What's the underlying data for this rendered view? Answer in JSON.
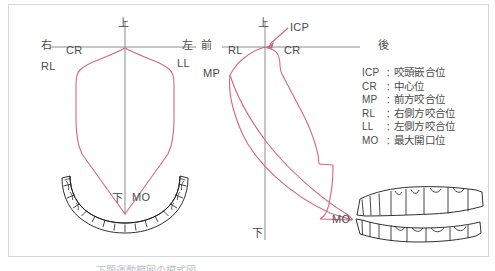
{
  "figure": {
    "background_color": "#ffffff",
    "frame_color": "#d2d7dd",
    "curve_color": "#d1697f",
    "axis_color": "#8c8c8c",
    "label_color": "#4b4b4b",
    "tooth_outline_color": "#1a1a1a"
  },
  "frontal_diagram": {
    "name": "frontal-posselt-envelope",
    "axis_labels": {
      "up": "上",
      "down": "下",
      "right": "右",
      "left": "左"
    },
    "point_labels": {
      "cr": "CR",
      "rl": "RL",
      "ll": "LL",
      "mo": "MO"
    }
  },
  "sagittal_diagram": {
    "name": "sagittal-posselt-envelope",
    "axis_labels": {
      "up": "上",
      "down": "下",
      "front": "前",
      "back": "後"
    },
    "point_labels": {
      "icp": "ICP",
      "cr": "CR",
      "rl": "RL",
      "mp": "MP",
      "mo": "MO"
    }
  },
  "legend": {
    "items": [
      {
        "abbr": "ICP",
        "colon": "：",
        "term": "咬頭嵌合位"
      },
      {
        "abbr": "CR",
        "colon": "：",
        "term": "中心位"
      },
      {
        "abbr": "MP",
        "colon": "：",
        "term": "前方咬合位"
      },
      {
        "abbr": "RL",
        "colon": "：",
        "term": "右側方咬合位"
      },
      {
        "abbr": "LL",
        "colon": "：",
        "term": "左側方咬合位"
      },
      {
        "abbr": "MO",
        "colon": "：",
        "term": "最大開口位"
      }
    ]
  },
  "caption": {
    "text": "下顕運動範囲の模式図"
  }
}
